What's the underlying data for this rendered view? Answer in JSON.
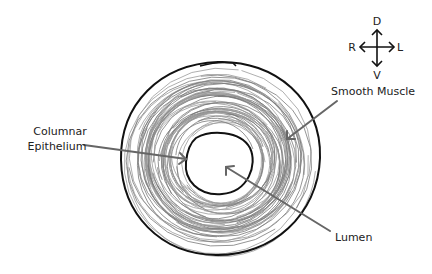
{
  "diagram": {
    "compass": {
      "dorsal": "D",
      "ventral": "V",
      "right": "R",
      "left": "L"
    },
    "labels": {
      "columnar_line1": "Columnar",
      "columnar_line2": "Epithelium",
      "smooth_muscle": "Smooth Muscle",
      "lumen": "Lumen"
    },
    "colors": {
      "outline": "#111111",
      "muscle_strokes": "#7a7a7a",
      "pointer": "#6b6b6b",
      "text": "#222222"
    }
  }
}
